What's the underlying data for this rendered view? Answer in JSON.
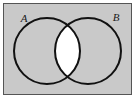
{
  "figure": {
    "kind": "venn-diagram",
    "frame": {
      "border_color": "#555555",
      "background_color": "#c9c9c9",
      "outer_margin_color": "#ffffff",
      "x": 3,
      "y": 3,
      "width": 129,
      "height": 92
    },
    "sets": [
      {
        "id": "A",
        "label": "A",
        "label_x": 24,
        "label_y": 22,
        "center_x": 47,
        "center_y": 51,
        "radius": 33,
        "stroke_color": "#111111",
        "stroke_width": 2,
        "fill_color": "#c9c9c9"
      },
      {
        "id": "B",
        "label": "B",
        "label_x": 116,
        "label_y": 21,
        "center_x": 88,
        "center_y": 51,
        "radius": 33,
        "stroke_color": "#111111",
        "stroke_width": 2,
        "fill_color": "#c9c9c9"
      }
    ],
    "intersection": {
      "id": "A-intersect-B",
      "fill_color": "#ffffff",
      "top_crossing_x": 67.5,
      "top_crossing_y": 21,
      "bottom_crossing_x": 67.5,
      "bottom_crossing_y": 81
    }
  }
}
